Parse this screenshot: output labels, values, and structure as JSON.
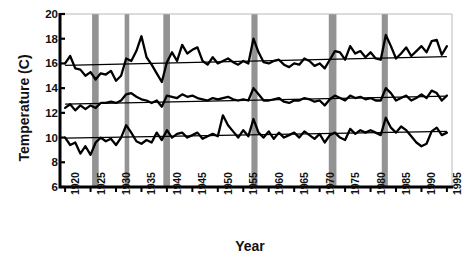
{
  "chart_data": {
    "type": "line",
    "title": "",
    "xlabel": "Year",
    "ylabel": "Temperature (C)",
    "xlim": [
      1919,
      1996
    ],
    "ylim": [
      6,
      20
    ],
    "ytick_values": [
      6,
      8,
      10,
      12,
      14,
      16,
      18,
      20
    ],
    "ytick_labels": [
      "6",
      "8",
      "10",
      "12",
      "14",
      "16",
      "18",
      "20"
    ],
    "xtick_values": [
      1920,
      1925,
      1930,
      1935,
      1940,
      1945,
      1950,
      1955,
      1960,
      1965,
      1970,
      1975,
      1980,
      1985,
      1990,
      1995
    ],
    "xtick_labels": [
      "1920",
      "1925",
      "1930",
      "1935",
      "1940",
      "1945",
      "1950",
      "1955",
      "1960",
      "1965",
      "1970",
      "1975",
      "1980",
      "1985",
      "1990",
      "1995"
    ],
    "grid": false,
    "legend": "none",
    "line_color": "#000000",
    "trend_color": "#000000",
    "band_color": "#808080",
    "shaded_bands": [
      {
        "start": 1925.3,
        "end": 1926.6
      },
      {
        "start": 1931.7,
        "end": 1932.6
      },
      {
        "start": 1939.3,
        "end": 1940.6
      },
      {
        "start": 1956.6,
        "end": 1957.8
      },
      {
        "start": 1971.8,
        "end": 1973.3
      },
      {
        "start": 1982.2,
        "end": 1983.4
      }
    ],
    "series": [
      {
        "name": "Upper series",
        "x": [
          1920,
          1921,
          1922,
          1923,
          1924,
          1925,
          1926,
          1927,
          1928,
          1929,
          1930,
          1931,
          1932,
          1933,
          1934,
          1935,
          1936,
          1937,
          1938,
          1939,
          1940,
          1941,
          1942,
          1943,
          1944,
          1945,
          1946,
          1947,
          1948,
          1949,
          1950,
          1951,
          1952,
          1953,
          1954,
          1955,
          1956,
          1957,
          1958,
          1959,
          1960,
          1961,
          1962,
          1963,
          1964,
          1965,
          1966,
          1967,
          1968,
          1969,
          1970,
          1971,
          1972,
          1973,
          1974,
          1975,
          1976,
          1977,
          1978,
          1979,
          1980,
          1981,
          1982,
          1983,
          1984,
          1985,
          1986,
          1987,
          1988,
          1989,
          1990,
          1991,
          1992,
          1993,
          1994,
          1995
        ],
        "y": [
          16.0,
          16.6,
          15.6,
          15.5,
          15.0,
          15.3,
          14.7,
          15.2,
          15.1,
          15.4,
          14.6,
          15.0,
          16.4,
          16.2,
          17.0,
          18.2,
          16.5,
          15.9,
          15.2,
          14.5,
          16.1,
          16.9,
          16.2,
          17.5,
          16.8,
          17.1,
          17.3,
          16.2,
          15.9,
          16.5,
          16.0,
          16.2,
          16.4,
          16.1,
          15.9,
          16.2,
          16.0,
          18.0,
          16.9,
          16.1,
          16.0,
          16.2,
          16.3,
          15.9,
          15.7,
          16.0,
          15.9,
          16.4,
          16.2,
          15.8,
          16.0,
          15.6,
          16.3,
          17.0,
          16.9,
          16.3,
          17.4,
          16.8,
          17.0,
          16.5,
          16.9,
          16.4,
          16.3,
          18.3,
          17.4,
          16.4,
          16.8,
          17.3,
          16.6,
          17.0,
          17.4,
          16.9,
          17.8,
          17.9,
          16.7,
          17.4
        ],
        "trend": {
          "x": [
            1920,
            1995
          ],
          "y": [
            15.85,
            16.55
          ]
        }
      },
      {
        "name": "Middle series",
        "x": [
          1920,
          1921,
          1922,
          1923,
          1924,
          1925,
          1926,
          1927,
          1928,
          1929,
          1930,
          1931,
          1932,
          1933,
          1934,
          1935,
          1936,
          1937,
          1938,
          1939,
          1940,
          1941,
          1942,
          1943,
          1944,
          1945,
          1946,
          1947,
          1948,
          1949,
          1950,
          1951,
          1952,
          1953,
          1954,
          1955,
          1956,
          1957,
          1958,
          1959,
          1960,
          1961,
          1962,
          1963,
          1964,
          1965,
          1966,
          1967,
          1968,
          1969,
          1970,
          1971,
          1972,
          1973,
          1974,
          1975,
          1976,
          1977,
          1978,
          1979,
          1980,
          1981,
          1982,
          1983,
          1984,
          1985,
          1986,
          1987,
          1988,
          1989,
          1990,
          1991,
          1992,
          1993,
          1994,
          1995
        ],
        "y": [
          12.4,
          12.7,
          12.2,
          12.6,
          12.3,
          12.6,
          12.4,
          12.8,
          12.8,
          12.9,
          12.8,
          13.0,
          13.5,
          13.6,
          13.3,
          13.1,
          13.0,
          12.8,
          13.0,
          12.5,
          13.4,
          13.3,
          13.2,
          13.5,
          13.3,
          13.4,
          13.2,
          13.1,
          13.0,
          13.2,
          13.1,
          13.2,
          13.3,
          13.1,
          13.0,
          13.1,
          13.0,
          14.0,
          13.5,
          13.0,
          13.0,
          13.1,
          13.2,
          12.9,
          12.8,
          13.0,
          13.0,
          13.2,
          13.1,
          12.9,
          13.0,
          12.6,
          13.1,
          13.4,
          13.2,
          13.0,
          13.4,
          13.2,
          13.3,
          13.1,
          13.2,
          13.0,
          13.0,
          14.0,
          13.6,
          13.0,
          13.2,
          13.4,
          13.0,
          13.2,
          13.5,
          13.2,
          13.8,
          13.6,
          13.0,
          13.4
        ],
        "trend": {
          "x": [
            1920,
            1995
          ],
          "y": [
            12.7,
            13.35
          ]
        }
      },
      {
        "name": "Lower series",
        "x": [
          1920,
          1921,
          1922,
          1923,
          1924,
          1925,
          1926,
          1927,
          1928,
          1929,
          1930,
          1931,
          1932,
          1933,
          1934,
          1935,
          1936,
          1937,
          1938,
          1939,
          1940,
          1941,
          1942,
          1943,
          1944,
          1945,
          1946,
          1947,
          1948,
          1949,
          1950,
          1951,
          1952,
          1953,
          1954,
          1955,
          1956,
          1957,
          1958,
          1959,
          1960,
          1961,
          1962,
          1963,
          1964,
          1965,
          1966,
          1967,
          1968,
          1969,
          1970,
          1971,
          1972,
          1973,
          1974,
          1975,
          1976,
          1977,
          1978,
          1979,
          1980,
          1981,
          1982,
          1983,
          1984,
          1985,
          1986,
          1987,
          1988,
          1989,
          1990,
          1991,
          1992,
          1993,
          1994,
          1995
        ],
        "y": [
          10.0,
          9.4,
          9.6,
          8.7,
          9.3,
          8.6,
          9.6,
          10.0,
          9.7,
          9.9,
          9.4,
          10.0,
          11.0,
          10.4,
          9.7,
          9.5,
          9.8,
          9.6,
          10.4,
          9.8,
          10.6,
          10.0,
          10.3,
          10.4,
          10.0,
          10.2,
          10.4,
          9.9,
          10.1,
          10.3,
          10.1,
          11.8,
          11.0,
          10.5,
          10.0,
          10.6,
          10.1,
          11.5,
          10.4,
          10.0,
          10.5,
          9.9,
          10.4,
          10.0,
          10.2,
          10.4,
          10.0,
          10.5,
          10.2,
          9.9,
          10.3,
          9.6,
          10.2,
          10.4,
          10.0,
          9.8,
          10.7,
          10.3,
          10.6,
          10.4,
          10.6,
          10.4,
          10.2,
          11.6,
          10.8,
          10.4,
          10.9,
          10.6,
          10.1,
          9.6,
          9.3,
          9.5,
          10.5,
          10.8,
          10.2,
          10.4
        ],
        "trend": {
          "x": [
            1920,
            1995
          ],
          "y": [
            9.95,
            10.5
          ]
        }
      }
    ]
  },
  "axis": {
    "y_title": "Temperature (C)",
    "x_title": "Year"
  }
}
